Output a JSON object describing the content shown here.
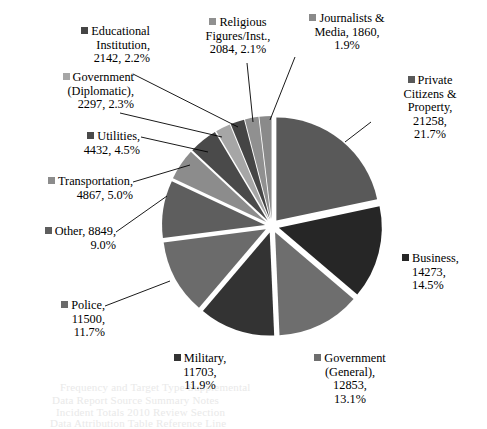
{
  "chart_data": {
    "type": "pie",
    "title": "",
    "legend_position": "callout-labels",
    "total": 97998,
    "categories": [
      "Private Citizens & Property",
      "Business",
      "Government (General)",
      "Military",
      "Police",
      "Other",
      "Transportation",
      "Utilities",
      "Government (Diplomatic)",
      "Educational Institution",
      "Religious Figures/Inst.",
      "Journalists & Media"
    ],
    "values": [
      21258,
      14273,
      12853,
      11703,
      11500,
      8849,
      4867,
      4432,
      2297,
      2142,
      2084,
      1860
    ],
    "percents": [
      "21.7%",
      "14.5%",
      "13.1%",
      "11.9%",
      "11.7%",
      "9.0%",
      "5.0%",
      "4.5%",
      "2.3%",
      "2.2%",
      "2.1%",
      "1.9%"
    ],
    "colors": [
      "#595959",
      "#262626",
      "#6E6E6E",
      "#333333",
      "#6B6B6B",
      "#5E5E5E",
      "#8C8C8C",
      "#4A4A4A",
      "#A6A6A6",
      "#454545",
      "#909090",
      "#8A8A8A"
    ],
    "slices": [
      {
        "label": "Private Citizens & Property",
        "value": 21258,
        "percent": "21.7%",
        "color": "#595959"
      },
      {
        "label": "Business",
        "value": 14273,
        "percent": "14.5%",
        "color": "#262626"
      },
      {
        "label": "Government (General)",
        "value": 12853,
        "percent": "13.1%",
        "color": "#6E6E6E"
      },
      {
        "label": "Military",
        "value": 11703,
        "percent": "11.9%",
        "color": "#333333"
      },
      {
        "label": "Police",
        "value": 11500,
        "percent": "11.7%",
        "color": "#6B6B6B"
      },
      {
        "label": "Other",
        "value": 8849,
        "percent": "9.0%",
        "color": "#5E5E5E"
      },
      {
        "label": "Transportation",
        "value": 4867,
        "percent": "5.0%",
        "color": "#8C8C8C"
      },
      {
        "label": "Utilities",
        "value": 4432,
        "percent": "4.5%",
        "color": "#4A4A4A"
      },
      {
        "label": "Government (Diplomatic)",
        "value": 2297,
        "percent": "2.3%",
        "color": "#A6A6A6"
      },
      {
        "label": "Educational Institution",
        "value": 2142,
        "percent": "2.2%",
        "color": "#454545"
      },
      {
        "label": "Religious Figures/Inst.",
        "value": 2084,
        "percent": "2.1%",
        "color": "#909090"
      },
      {
        "label": "Journalists & Media",
        "value": 1860,
        "percent": "1.9%",
        "color": "#8A8A8A"
      }
    ]
  },
  "labels": {
    "educational_institution": {
      "l1": "Educational",
      "l2": "Institution,",
      "l3": "2142, 2.2%",
      "color": "#454545"
    },
    "government_diplomatic": {
      "l1": "Government",
      "l2": "(Diplomatic),",
      "l3": "2297, 2.3%",
      "color": "#A6A6A6"
    },
    "utilities": {
      "l1": "Utilities,",
      "l2": "4432, 4.5%",
      "color": "#4A4A4A"
    },
    "transportation": {
      "l1": "Transportation,",
      "l2": "4867, 5.0%",
      "color": "#8C8C8C"
    },
    "other": {
      "l1": "Other, 8849,",
      "l2": "9.0%",
      "color": "#5E5E5E"
    },
    "police": {
      "l1": "Police,",
      "l2": "11500,",
      "l3": "11.7%",
      "color": "#6B6B6B"
    },
    "military": {
      "l1": "Military,",
      "l2": "11703,",
      "l3": "11.9%",
      "color": "#333333"
    },
    "government_general": {
      "l1": "Government",
      "l2": "(General),",
      "l3": "12853,",
      "l4": "13.1%",
      "color": "#6E6E6E"
    },
    "business": {
      "l1": "Business,",
      "l2": "14273,",
      "l3": "14.5%",
      "color": "#262626"
    },
    "private_citizens": {
      "l1": "Private",
      "l2": "Citizens &",
      "l3": "Property,",
      "l4": "21258,",
      "l5": "21.7%",
      "color": "#595959"
    },
    "religious_figures": {
      "l1": "Religious",
      "l2": "Figures/Inst.,",
      "l3": "2084, 2.1%",
      "color": "#909090"
    },
    "journalists_media": {
      "l1": "Journalists &",
      "l2": "Media, 1860,",
      "l3": "1.9%",
      "color": "#8A8A8A"
    }
  },
  "background_text": {
    "line1": "Frequency and Target Type Supplemental",
    "line2": "Data Report Source Summary Notes",
    "line3": "Incident Totals 2010 Review Section",
    "line4": "Data Attribution Table Reference Line"
  }
}
